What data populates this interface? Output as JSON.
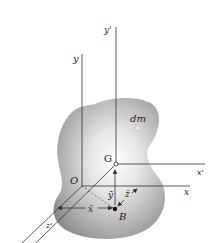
{
  "diagram": {
    "type": "rigid-body-3d-axes",
    "body": {
      "label": "dm",
      "color": "#9a9a9a"
    },
    "points": {
      "origin": {
        "label": "O"
      },
      "center_of_mass": {
        "label": "G"
      },
      "projection": {
        "label": "B"
      }
    },
    "axes": {
      "y": "y",
      "x": "x",
      "z": "z",
      "y_prime": "y'",
      "x_prime": "x'",
      "z_prime": "z'"
    },
    "dimensions": {
      "x_bar": "x̄",
      "y_bar": "ȳ",
      "z_bar": "z̄"
    },
    "colors": {
      "line": "#333333",
      "label": "#222222",
      "background": "#ffffff"
    }
  }
}
